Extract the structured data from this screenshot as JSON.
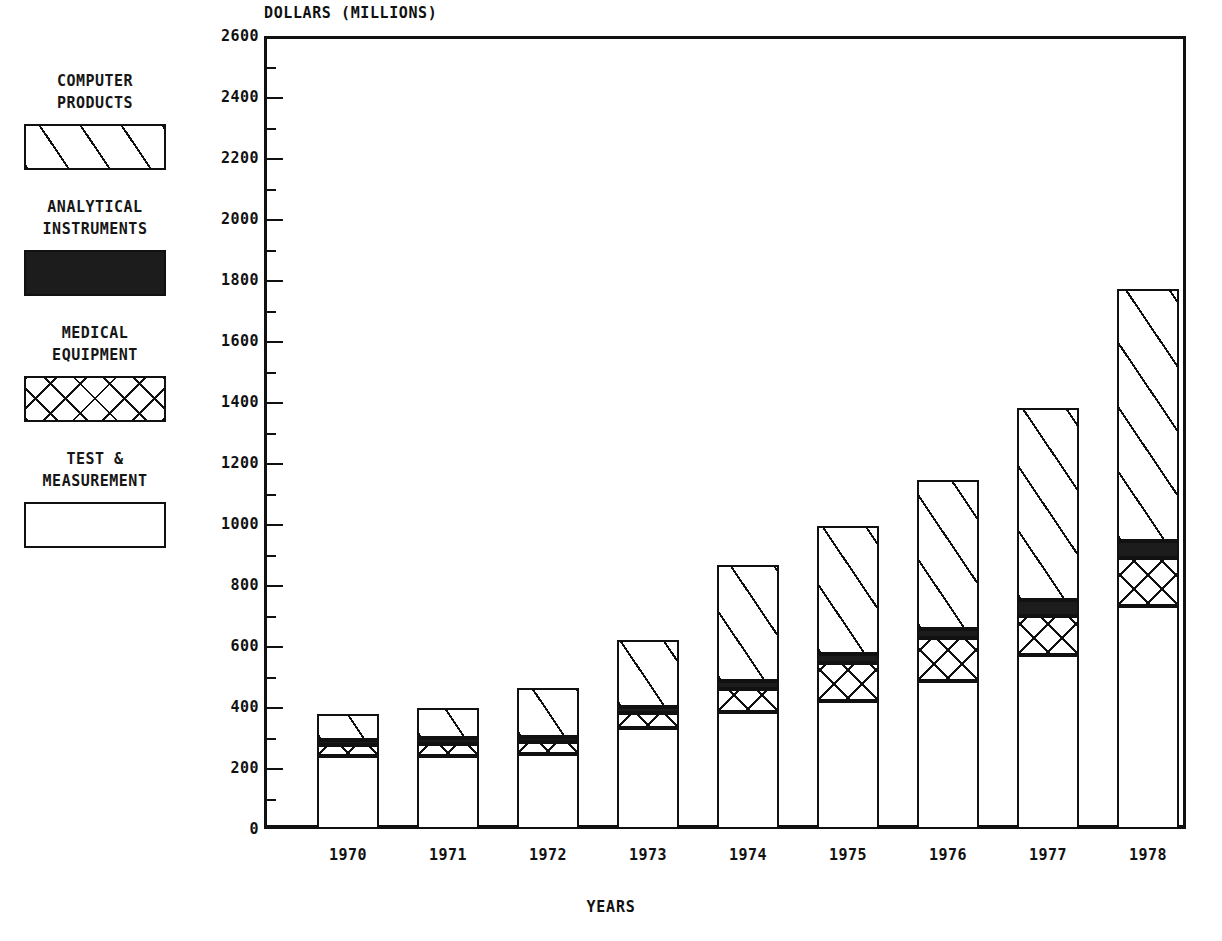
{
  "chart_data": {
    "type": "bar",
    "subtype": "stacked-vertical",
    "title": "",
    "xlabel": "YEARS",
    "ylabel": "DOLLARS (MILLIONS)",
    "categories": [
      "1970",
      "1971",
      "1972",
      "1973",
      "1974",
      "1975",
      "1976",
      "1977",
      "1978"
    ],
    "ylim": [
      0,
      2600
    ],
    "y_major_step": 200,
    "y_minor_step": 100,
    "y_ticks": [
      0,
      200,
      400,
      600,
      800,
      1000,
      1200,
      1400,
      1600,
      1800,
      2000,
      2200,
      2400,
      2600
    ],
    "y_tick_labels": [
      "0",
      "200",
      "400",
      "600",
      "800",
      "1000",
      "1200",
      "1400",
      "1600",
      "1800",
      "2000",
      "2200",
      "2400",
      "2600"
    ],
    "grid": false,
    "legend_position": "left",
    "stack_order_bottom_to_top": [
      "TEST & MEASUREMENT",
      "MEDICAL EQUIPMENT",
      "ANALYTICAL INSTRUMENTS",
      "COMPUTER PRODUCTS"
    ],
    "series": [
      {
        "name": "TEST & MEASUREMENT",
        "pattern": "empty",
        "values": [
          240,
          240,
          245,
          330,
          385,
          420,
          485,
          570,
          730
        ]
      },
      {
        "name": "MEDICAL EQUIPMENT",
        "pattern": "cross-hatch",
        "values": [
          35,
          40,
          40,
          50,
          75,
          125,
          140,
          130,
          160
        ]
      },
      {
        "name": "ANALYTICAL INSTRUMENTS",
        "pattern": "solid",
        "values": [
          18,
          18,
          18,
          20,
          25,
          30,
          30,
          50,
          55
        ]
      },
      {
        "name": "COMPUTER PRODUCTS",
        "pattern": "diagonal",
        "values": [
          85,
          100,
          160,
          220,
          380,
          420,
          490,
          630,
          825
        ]
      }
    ],
    "totals": [
      378,
      398,
      463,
      620,
      865,
      995,
      1145,
      1380,
      1770
    ]
  },
  "legend": {
    "items": [
      {
        "label_line1": "COMPUTER",
        "label_line2": "PRODUCTS",
        "pattern": "diagonal"
      },
      {
        "label_line1": "ANALYTICAL",
        "label_line2": "INSTRUMENTS",
        "pattern": "solid"
      },
      {
        "label_line1": "MEDICAL",
        "label_line2": "EQUIPMENT",
        "pattern": "cross-hatch"
      },
      {
        "label_line1": "TEST &",
        "label_line2": "MEASUREMENT",
        "pattern": "empty"
      }
    ]
  },
  "colors": {
    "ink": "#111111",
    "solid_fill": "#1c1c1c",
    "background": "#ffffff"
  }
}
